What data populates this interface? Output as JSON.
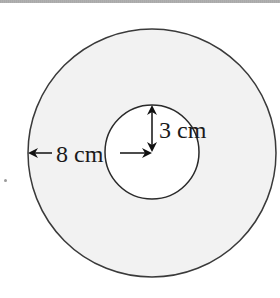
{
  "figure": {
    "type": "annulus",
    "outer_circle": {
      "cx": 152,
      "cy": 153,
      "r": 124,
      "fill": "#f2f2f2",
      "stroke": "#3a3a3a"
    },
    "inner_circle": {
      "cx": 152,
      "cy": 152,
      "r": 47,
      "fill": "#ffffff",
      "stroke": "#2a2a2a"
    },
    "labels": {
      "outer_radius": "8 cm",
      "inner_radius": "3 cm"
    },
    "measurements": {
      "outer_radius_cm": 8,
      "inner_radius_cm": 3
    }
  }
}
